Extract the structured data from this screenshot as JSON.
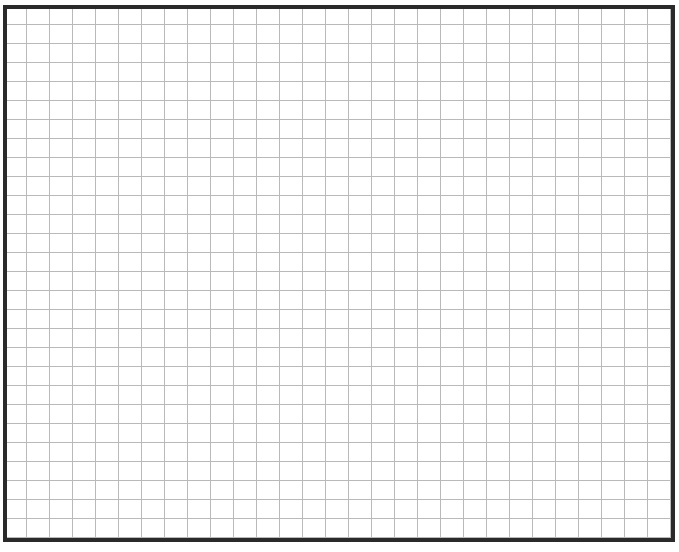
{
  "grid": {
    "border_color": "#2a2a2a",
    "line_color": "#b9b9b9",
    "background_color": "#ffffff",
    "cell_width_px": 23,
    "cell_height_px": 19,
    "columns": 29,
    "rows": 28
  }
}
